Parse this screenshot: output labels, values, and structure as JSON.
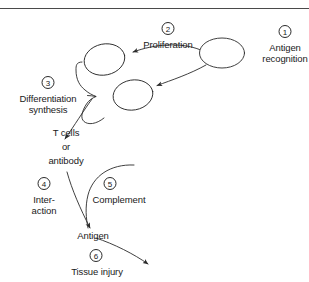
{
  "figure": {
    "width": 309,
    "height": 282,
    "background": "#ffffff",
    "line_color": "#2a2a2a",
    "text_color": "#1a1a1a",
    "rule_color": "#4a4a4a"
  },
  "steps": [
    {
      "id": "step-1",
      "number": "1",
      "label": "Antigen\nrecognition"
    },
    {
      "id": "step-2",
      "number": "2",
      "label": "Proliferation"
    },
    {
      "id": "step-3",
      "number": "3",
      "label": "Differentiation\nsynthesis"
    },
    {
      "id": "step-4",
      "number": "4",
      "label": "Inter-\naction"
    },
    {
      "id": "step-5",
      "number": "5",
      "label": "Complement"
    },
    {
      "id": "step-6",
      "number": "6",
      "label": "Tissue injury"
    }
  ],
  "nodes": {
    "antigen_recognition_number": "1",
    "antigen_recognition_line1": "Antigen",
    "antigen_recognition_line2": "recognition",
    "proliferation_number": "2",
    "proliferation_label": "Proliferation",
    "differentiation_number": "3",
    "differentiation_line1": "Differentiation",
    "differentiation_line2": "synthesis",
    "product_line1": "T cells",
    "product_line2": "or",
    "product_line3": "antibody",
    "interaction_number": "4",
    "interaction_line1": "Inter-",
    "interaction_line2": "action",
    "complement_number": "5",
    "complement_label": "Complement",
    "antigen_label": "Antigen",
    "tissue_injury_number": "6",
    "tissue_injury_label": "Tissue injury"
  },
  "cells": [
    {
      "name": "presenting-cell",
      "cx": 222,
      "cy": 53,
      "rx": 22,
      "ry": 15
    },
    {
      "name": "daughter-cell-upper",
      "cx": 104,
      "cy": 60,
      "rx": 21,
      "ry": 16
    },
    {
      "name": "daughter-cell-lower",
      "cx": 133,
      "cy": 95,
      "rx": 20,
      "ry": 15
    }
  ]
}
